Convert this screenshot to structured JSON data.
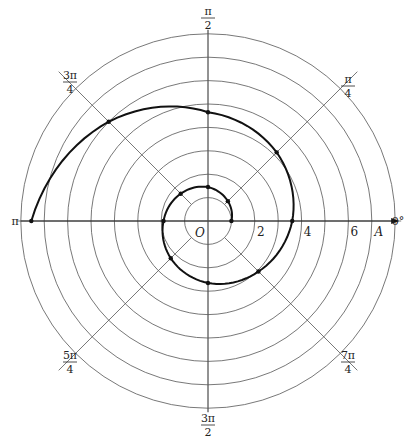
{
  "chart_data": {
    "type": "polar",
    "title": "",
    "grid": {
      "circles": [
        1,
        2,
        3,
        4,
        5,
        6,
        7,
        8
      ],
      "radial_lines_deg": [
        0,
        45,
        90,
        135,
        180,
        225,
        270,
        315
      ]
    },
    "angle_labels": [
      {
        "id": "a0",
        "num": "0°",
        "den": "",
        "angle_deg": 0
      },
      {
        "id": "a45",
        "num": "π",
        "den": "4",
        "angle_deg": 45
      },
      {
        "id": "a90",
        "num": "π",
        "den": "2",
        "angle_deg": 90
      },
      {
        "id": "a135",
        "num": "3π",
        "den": "4",
        "angle_deg": 135
      },
      {
        "id": "a180",
        "num": "π",
        "den": "",
        "angle_deg": 180
      },
      {
        "id": "a225",
        "num": "5π",
        "den": "4",
        "angle_deg": 225
      },
      {
        "id": "a270",
        "num": "3π",
        "den": "2",
        "angle_deg": 270
      },
      {
        "id": "a315",
        "num": "7π",
        "den": "4",
        "angle_deg": 315
      }
    ],
    "radial_tick_labels": [
      {
        "text": "2",
        "r": 2
      },
      {
        "text": "4",
        "r": 4
      },
      {
        "text": "6",
        "r": 6
      }
    ],
    "origin_label": "O",
    "axis_label": "A",
    "points": [
      {
        "theta": "0",
        "theta_rad": 0.0,
        "r": 1.0
      },
      {
        "theta": "π/4",
        "theta_rad": 0.7854,
        "r": 1.2
      },
      {
        "theta": "π/2",
        "theta_rad": 1.5708,
        "r": 1.45
      },
      {
        "theta": "3π/4",
        "theta_rad": 2.3562,
        "r": 1.65
      },
      {
        "theta": "π",
        "theta_rad": 3.1416,
        "r": 1.9
      },
      {
        "theta": "5π/4",
        "theta_rad": 3.927,
        "r": 2.25
      },
      {
        "theta": "3π/2",
        "theta_rad": 4.7124,
        "r": 2.65
      },
      {
        "theta": "7π/4",
        "theta_rad": 5.4978,
        "r": 3.05
      },
      {
        "theta": "2π",
        "theta_rad": 6.2832,
        "r": 3.6
      },
      {
        "theta": "9π/4",
        "theta_rad": 7.0686,
        "r": 4.15
      },
      {
        "theta": "5π/2",
        "theta_rad": 7.854,
        "r": 4.65
      },
      {
        "theta": "11π/4",
        "theta_rad": 8.6394,
        "r": 6.0
      },
      {
        "theta": "3π",
        "theta_rad": 9.4248,
        "r": 7.55
      }
    ],
    "rlim": [
      0,
      8
    ]
  },
  "colors": {
    "grid": "#555555",
    "curve": "#111111",
    "text": "#222222"
  }
}
